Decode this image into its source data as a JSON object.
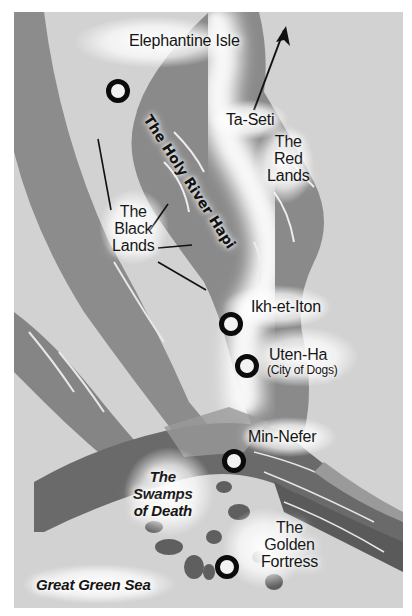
{
  "map": {
    "colors": {
      "desert": "#d2d2d2",
      "land_dark": "#8a8a8a",
      "land_darker": "#6f6f6f",
      "delta_dark": "#5e5e5e",
      "river_glow": "#f4f4f4",
      "marker_ring": "#0b0b0b",
      "marker_center": "#f2f2f2",
      "text": "#151515"
    },
    "north_arrow": {
      "label": "",
      "direction": "north-east"
    },
    "river_label": "The Holy River Hapi",
    "regions": {
      "ta_seti": "Ta-Seti",
      "red_lands": [
        "The",
        "Red",
        "Lands"
      ],
      "black_lands": [
        "The",
        "Black",
        "Lands"
      ],
      "swamps": [
        "The",
        "Swamps",
        "of Death"
      ],
      "sea": "Great Green Sea"
    },
    "cities": [
      {
        "name": "Elephantine Isle",
        "subtitle": ""
      },
      {
        "name": "Ikh-et-Iton",
        "subtitle": ""
      },
      {
        "name": "Uten-Ha",
        "subtitle": "(City of Dogs)"
      },
      {
        "name": "Min-Nefer",
        "subtitle": ""
      },
      {
        "name": "The Golden Fortress",
        "lines": [
          "The",
          "Golden",
          "Fortress"
        ],
        "subtitle": ""
      }
    ]
  }
}
